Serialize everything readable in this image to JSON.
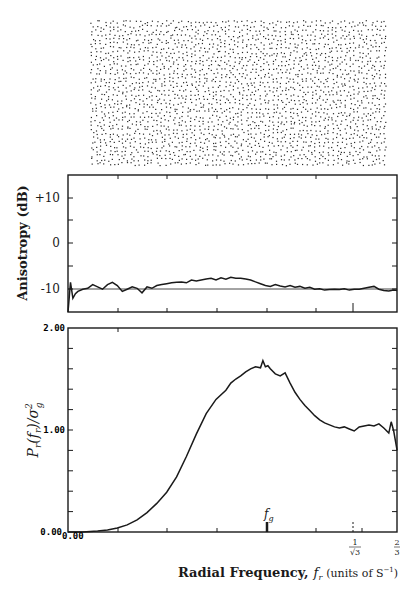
{
  "chart_data": [
    {
      "type": "scatter",
      "title": "Blue-noise dot pattern (point distribution sample)",
      "panel": "top",
      "description": "Rectangular field of randomly but evenly distributed black dots",
      "bounds_px": {
        "x": 90,
        "y": 20,
        "w": 293,
        "h": 143
      }
    },
    {
      "type": "line",
      "panel": "middle",
      "ylabel": "Anisotropy (dB)",
      "xlabel": "",
      "ylim": [
        -15,
        15
      ],
      "yticks": [
        {
          "value": 10,
          "label": "+10"
        },
        {
          "value": 0,
          "label": "0"
        },
        {
          "value": -10,
          "label": "-10"
        }
      ],
      "minor_yticks": [
        15,
        5,
        -5
      ],
      "reference_line": -10,
      "xlim": [
        0,
        0.6667
      ],
      "x": [
        0.0,
        0.005,
        0.01,
        0.015,
        0.02,
        0.03,
        0.04,
        0.05,
        0.06,
        0.07,
        0.08,
        0.09,
        0.1,
        0.11,
        0.12,
        0.13,
        0.14,
        0.15,
        0.16,
        0.17,
        0.18,
        0.19,
        0.2,
        0.21,
        0.22,
        0.23,
        0.24,
        0.25,
        0.26,
        0.27,
        0.28,
        0.29,
        0.3,
        0.31,
        0.32,
        0.33,
        0.34,
        0.35,
        0.36,
        0.37,
        0.38,
        0.39,
        0.4,
        0.41,
        0.42,
        0.43,
        0.44,
        0.45,
        0.46,
        0.47,
        0.48,
        0.49,
        0.5,
        0.51,
        0.52,
        0.53,
        0.54,
        0.55,
        0.56,
        0.57,
        0.58,
        0.59,
        0.6,
        0.61,
        0.62,
        0.63,
        0.64,
        0.65,
        0.66,
        0.667
      ],
      "values": [
        -15,
        -8.5,
        -12,
        -11,
        -10.5,
        -10,
        -9.8,
        -9,
        -9.5,
        -10,
        -9,
        -8.5,
        -9.2,
        -10.5,
        -10,
        -9.5,
        -9.8,
        -10.8,
        -9.5,
        -9.8,
        -9.2,
        -9,
        -8.8,
        -8.6,
        -8.5,
        -8.4,
        -8.6,
        -8,
        -8.2,
        -8,
        -7.8,
        -7.6,
        -8,
        -7.5,
        -7.8,
        -7.4,
        -7.6,
        -7.6,
        -7.8,
        -8,
        -8.4,
        -8.8,
        -9.2,
        -9.4,
        -9,
        -9.3,
        -9.5,
        -9.2,
        -9.6,
        -9.4,
        -9.8,
        -9.6,
        -10,
        -9.9,
        -10.2,
        -10.1,
        -10,
        -10.1,
        -9.9,
        -10.2,
        -10,
        -10,
        -9.8,
        -9.6,
        -9.4,
        -10,
        -10.3,
        -10.4,
        -10.2,
        -10.3
      ],
      "markers": [
        {
          "x": 0.5774,
          "label": "1/√3 tick"
        }
      ]
    },
    {
      "type": "line",
      "panel": "bottom",
      "ylabel": "P_r(f_r)/σ_g²",
      "xlabel": "Radial Frequency, f_r (units of S⁻¹)",
      "ylim": [
        0,
        2
      ],
      "yticks": [
        {
          "value": 2.0,
          "label": "2.00"
        },
        {
          "value": 1.0,
          "label": "1.00"
        },
        {
          "value": 0.0,
          "label": "0.00"
        }
      ],
      "xlim": [
        0,
        0.6667
      ],
      "xticks": [
        {
          "value": 0,
          "label": "0.00"
        },
        {
          "value": 0.5774,
          "label": "1/√3"
        },
        {
          "value": 0.6667,
          "label": "2/3"
        }
      ],
      "annotations": [
        {
          "x": 0.404,
          "label": "f_g",
          "kind": "arrow"
        }
      ],
      "x": [
        0.0,
        0.03,
        0.06,
        0.08,
        0.1,
        0.12,
        0.14,
        0.16,
        0.18,
        0.2,
        0.22,
        0.24,
        0.26,
        0.28,
        0.3,
        0.32,
        0.33,
        0.34,
        0.35,
        0.36,
        0.37,
        0.38,
        0.39,
        0.395,
        0.4,
        0.405,
        0.41,
        0.42,
        0.43,
        0.44,
        0.45,
        0.46,
        0.47,
        0.48,
        0.49,
        0.5,
        0.51,
        0.52,
        0.53,
        0.54,
        0.55,
        0.56,
        0.57,
        0.58,
        0.59,
        0.6,
        0.61,
        0.62,
        0.63,
        0.64,
        0.65,
        0.655,
        0.66,
        0.667
      ],
      "values": [
        0.0,
        0.0,
        0.01,
        0.02,
        0.04,
        0.07,
        0.12,
        0.19,
        0.28,
        0.39,
        0.54,
        0.74,
        0.96,
        1.16,
        1.3,
        1.39,
        1.46,
        1.5,
        1.53,
        1.57,
        1.6,
        1.62,
        1.61,
        1.68,
        1.62,
        1.63,
        1.6,
        1.55,
        1.53,
        1.56,
        1.46,
        1.37,
        1.3,
        1.24,
        1.19,
        1.14,
        1.1,
        1.07,
        1.05,
        1.03,
        1.02,
        1.03,
        1.01,
        0.99,
        1.03,
        1.04,
        1.05,
        1.04,
        1.06,
        1.02,
        0.97,
        1.08,
        0.99,
        0.8
      ]
    }
  ],
  "labels": {
    "mid_ylabel": "Anisotropy (dB)",
    "mid_tick_p10": "+10",
    "mid_tick_0": "0",
    "mid_tick_m10": "-10",
    "bot_ylabel_main": "P",
    "bot_ylabel_sub": "r",
    "bot_ylabel_rest1": "(f",
    "bot_ylabel_rest2": ")/σ",
    "bot_ylabel_sup": "2",
    "bot_ylabel_gsub": "g",
    "bot_tick_2": "2.00",
    "bot_tick_1": "1.00",
    "bot_tick_0y": "0.00",
    "bot_tick_0x": "0.00",
    "fg_label": "f",
    "fg_sub": "g",
    "tick_sqrt3_num": "1",
    "tick_sqrt3_den": "√3",
    "tick_23_num": "2",
    "tick_23_den": "3",
    "xlabel_bold": "Radial Frequency,",
    "xlabel_var": "f",
    "xlabel_var_sub": "r",
    "xlabel_units": "(units of S",
    "xlabel_units_sup": "−1",
    "xlabel_close": ")"
  },
  "colors": {
    "ink": "#1a1a1a",
    "paper": "#ffffff",
    "dots": "#2a2a2a"
  }
}
